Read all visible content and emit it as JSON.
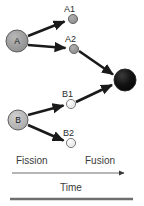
{
  "figure": {
    "colors": {
      "parent_a_fill": "#9a9a9a",
      "parent_b_fill": "#b5b5b5",
      "child_a_fill": "#9a9a9a",
      "child_b_fill": "#e8e8e8",
      "product_fill": "#121212",
      "arrow": "#1a1a1a",
      "stroke": "#4a4a4a",
      "text": "#2b2b2b",
      "axis": "#6e6e6e",
      "rule": "#6e6e6e"
    },
    "nodes": [
      {
        "id": "A",
        "label": "A",
        "caption": "",
        "cx": 17,
        "cy": 41,
        "r": 11,
        "fill": "#9a9a9a",
        "has_inner_text": true
      },
      {
        "id": "A1",
        "label": "",
        "caption": "A1",
        "cx": 73,
        "cy": 19,
        "r": 4.5,
        "fill": "#9a9a9a",
        "has_inner_text": false
      },
      {
        "id": "A2",
        "label": "",
        "caption": "A2",
        "cx": 74,
        "cy": 49,
        "r": 4.5,
        "fill": "#9a9a9a",
        "has_inner_text": false
      },
      {
        "id": "B",
        "label": "B",
        "caption": "",
        "cx": 18,
        "cy": 120,
        "r": 10,
        "fill": "#b5b5b5",
        "has_inner_text": true
      },
      {
        "id": "B1",
        "label": "",
        "caption": "B1",
        "cx": 71,
        "cy": 104,
        "r": 4.5,
        "fill": "#efefef",
        "has_inner_text": false
      },
      {
        "id": "B2",
        "label": "",
        "caption": "B2",
        "cx": 71,
        "cy": 143,
        "r": 4.5,
        "fill": "#efefef",
        "has_inner_text": false
      },
      {
        "id": "C",
        "label": "",
        "caption": "",
        "cx": 125,
        "cy": 80,
        "r": 11,
        "fill": "#121212",
        "has_inner_text": false
      }
    ],
    "node_captions": [
      {
        "id": "A1",
        "text": "A1",
        "x": 64,
        "y": 11
      },
      {
        "id": "A2",
        "text": "A2",
        "x": 65,
        "y": 41
      },
      {
        "id": "B1",
        "text": "B1",
        "x": 62,
        "y": 96
      },
      {
        "id": "B2",
        "text": "B2",
        "x": 63,
        "y": 135
      }
    ],
    "node_inner_labels": [
      {
        "id": "A",
        "text": "A",
        "x": 17,
        "y": 41
      },
      {
        "id": "B",
        "text": "B",
        "x": 18,
        "y": 120
      }
    ],
    "arrows": [
      {
        "from": "A",
        "to": "A1",
        "x1": 28,
        "y1": 36,
        "x2": 66,
        "y2": 21
      },
      {
        "from": "A",
        "to": "A2",
        "x1": 28,
        "y1": 45,
        "x2": 67,
        "y2": 48
      },
      {
        "from": "A2",
        "to": "C",
        "x1": 80,
        "y1": 51,
        "x2": 115,
        "y2": 75
      },
      {
        "from": "B1",
        "to": "C",
        "x1": 77,
        "y1": 102,
        "x2": 114,
        "y2": 84
      },
      {
        "from": "B",
        "to": "B1",
        "x1": 28,
        "y1": 115,
        "x2": 65,
        "y2": 105
      },
      {
        "from": "B",
        "to": "B2",
        "x1": 28,
        "y1": 125,
        "x2": 65,
        "y2": 141
      }
    ],
    "phase_labels": [
      {
        "id": "fission",
        "text": "Fission",
        "x": 16,
        "y": 164
      },
      {
        "id": "fusion",
        "text": "Fusion",
        "x": 85,
        "y": 164
      }
    ],
    "time_axis": {
      "label": "Time",
      "label_x": 71,
      "label_y": 188,
      "line_x1": 12,
      "line_x2": 128,
      "line_y": 173
    },
    "bottom_rule": {
      "x1": 10,
      "x2": 133,
      "y": 199
    }
  }
}
